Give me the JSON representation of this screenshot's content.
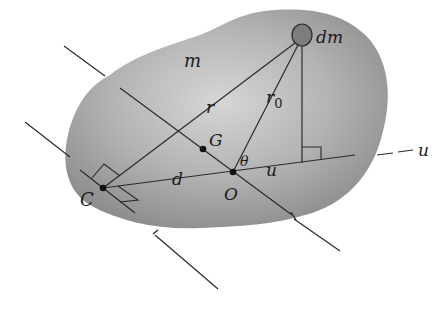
{
  "figure": {
    "colors": {
      "body_fill_light": "#cfcfcf",
      "body_fill_dark": "#8f8f8f",
      "line": "#2a2a2a",
      "dm_fill": "#7d7d7d"
    }
  },
  "labels": {
    "body_mass": "m",
    "element_mass": "dm",
    "radius_from_C": "r",
    "radius_from_O_base": "r",
    "radius_from_O_sub": "0",
    "center_of_mass": "G",
    "point_C": "C",
    "point_O": "O",
    "distance": "d",
    "angle": "θ",
    "axis_inside": "u",
    "axis_outside": "u"
  }
}
